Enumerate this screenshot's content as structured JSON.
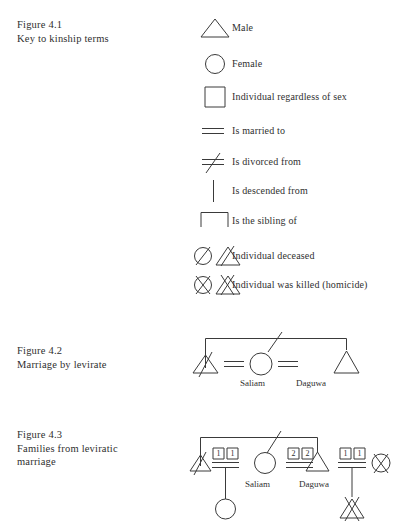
{
  "figures": {
    "fig41": {
      "caption": "Figure 4.1\nKey to kinship terms",
      "legend": [
        {
          "symbol": "triangle-icon",
          "label": "Male"
        },
        {
          "symbol": "circle-icon",
          "label": "Female"
        },
        {
          "symbol": "square-icon",
          "label": "Individual regardless of sex"
        },
        {
          "symbol": "double-line-icon",
          "label": "Is married to"
        },
        {
          "symbol": "double-line-slash-icon",
          "label": "Is divorced from"
        },
        {
          "symbol": "vertical-line-icon",
          "label": "Is descended from"
        },
        {
          "symbol": "sibling-bracket-icon",
          "label": "Is the sibling of"
        },
        {
          "symbol": "slashed-circle-and-triangle-icon",
          "label": "Individual deceased"
        },
        {
          "symbol": "crossed-circle-and-triangle-icon",
          "label": "Individual was killed (homicide)"
        }
      ]
    },
    "fig42": {
      "caption": "Figure 4.2\nMarriage by levirate",
      "names": {
        "wife": "Saliam",
        "husband": "Daguwa"
      }
    },
    "fig43": {
      "caption": "Figure 4.3\nFamilies from leviratic\nmarriage",
      "names": {
        "wife": "Saliam",
        "husband": "Daguwa"
      },
      "marriage_boxes": {
        "left": [
          "1",
          "1"
        ],
        "middle": [
          "2",
          "2"
        ],
        "right": [
          "1",
          "1"
        ]
      }
    }
  },
  "colors": {
    "ink": "#3a3a3a",
    "text": "#2f2f2f",
    "background": "#ffffff"
  }
}
